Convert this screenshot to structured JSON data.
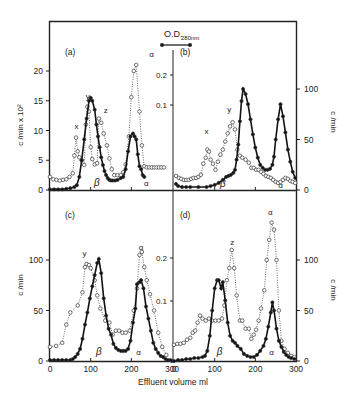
{
  "figure": {
    "xlabel": "Effluent volume  ml",
    "left_ylabel_top": "c /min x 10²",
    "left_ylabel_bottom": "c /min",
    "right_ylabel": "c /min",
    "od_label": "O.D.",
    "od_sub": "280nm",
    "colors": {
      "line": "#111111",
      "dotted": "#333333",
      "axis": "#222222"
    }
  },
  "chart_data": [
    {
      "panel": "a",
      "type": "line",
      "label": "(a)",
      "xlabel": "",
      "ylabel": "c /min x 10²",
      "xlim": [
        0,
        300
      ],
      "ylim": [
        0,
        23
      ],
      "yticks": [
        0,
        5,
        10,
        15,
        20
      ],
      "od_ticks": [
        "0.1",
        "0.2"
      ],
      "annotations": [
        {
          "text": "x",
          "x": 65,
          "y": 10.3
        },
        {
          "text": "y",
          "x": 93,
          "y": 15.3
        },
        {
          "text": "z",
          "x": 137,
          "y": 13.0
        },
        {
          "text": "α",
          "x": 250,
          "y": 22.3
        },
        {
          "text": "β",
          "x": 115,
          "y": 0.6,
          "italic": true
        },
        {
          "text": "α",
          "x": 237,
          "y": 0.6
        }
      ],
      "series": [
        {
          "name": "radioactivity (open circles)",
          "style": "dotted-open",
          "x": [
            0,
            8,
            16,
            24,
            32,
            40,
            48,
            56,
            60,
            64,
            68,
            72,
            78,
            84,
            88,
            92,
            96,
            100,
            104,
            110,
            116,
            120,
            126,
            132,
            140,
            146,
            152,
            158,
            166,
            174,
            180,
            186,
            194,
            200,
            206,
            212,
            220,
            226,
            232,
            238,
            244,
            250,
            256,
            262,
            268,
            274,
            280
          ],
          "y": [
            2.2,
            1.8,
            1.7,
            1.6,
            1.7,
            1.8,
            2.2,
            2.8,
            5.8,
            8.8,
            6.5,
            5.5,
            5.0,
            4.2,
            11.0,
            14.0,
            13.2,
            7.2,
            5.2,
            4.3,
            4.5,
            12.0,
            11.3,
            9.5,
            7.5,
            5.3,
            3.5,
            2.5,
            2.5,
            2.5,
            3.0,
            4.3,
            9.0,
            15.6,
            20.0,
            21.0,
            13.2,
            7.5,
            4.0,
            3.8,
            3.8,
            3.8,
            3.8,
            3.8,
            3.8,
            3.8,
            3.8
          ]
        },
        {
          "name": "protein (filled circles)",
          "style": "solid-filled",
          "x": [
            0,
            10,
            20,
            30,
            40,
            50,
            60,
            66,
            72,
            78,
            84,
            90,
            96,
            100,
            104,
            110,
            114,
            118,
            122,
            126,
            130,
            134,
            138,
            142,
            146,
            150,
            154,
            160,
            166,
            174,
            180,
            186,
            192,
            198,
            204,
            208,
            212,
            216,
            220,
            224,
            228,
            232
          ],
          "y": [
            0.1,
            0.1,
            0.1,
            0.1,
            0.2,
            0.3,
            0.5,
            0.8,
            2.2,
            5.0,
            8.5,
            12.0,
            15.0,
            15.5,
            15.0,
            13.5,
            11.0,
            9.0,
            7.2,
            5.5,
            4.2,
            3.2,
            2.5,
            2.0,
            1.7,
            1.6,
            1.6,
            1.6,
            1.7,
            2.0,
            2.2,
            3.5,
            6.5,
            9.0,
            9.5,
            9.0,
            8.5,
            6.0,
            4.0,
            3.5,
            2.5,
            2.2
          ]
        }
      ]
    },
    {
      "panel": "b",
      "type": "line",
      "label": "(b)",
      "ylabel": "c /min",
      "xlim": [
        0,
        300
      ],
      "ylim": [
        0,
        115
      ],
      "yticks": [
        0,
        50,
        100
      ],
      "annotations": [
        {
          "text": "x",
          "x": 80,
          "y": 55
        },
        {
          "text": "y",
          "x": 136,
          "y": 77
        },
        {
          "text": "β",
          "x": 120,
          "y": 3,
          "italic": true
        },
        {
          "text": "α",
          "x": 262,
          "y": 2
        }
      ],
      "series": [
        {
          "name": "radioactivity (open circles)",
          "style": "dotted-open",
          "x": [
            5,
            12,
            18,
            24,
            30,
            36,
            42,
            48,
            54,
            60,
            66,
            72,
            78,
            82,
            86,
            90,
            96,
            102,
            108,
            114,
            120,
            126,
            132,
            138,
            144,
            150,
            156,
            162,
            168,
            176,
            184,
            190,
            196,
            202,
            208,
            214,
            220,
            226,
            232,
            238,
            244,
            250,
            256,
            262,
            268,
            274,
            280,
            286,
            292,
            298
          ],
          "y": [
            14,
            12,
            11,
            10,
            10,
            10,
            11,
            12,
            12,
            13,
            15,
            26,
            32,
            40,
            38,
            30,
            26,
            20,
            28,
            35,
            40,
            48,
            56,
            63,
            67,
            60,
            40,
            34,
            32,
            30,
            27,
            22,
            22,
            20,
            20,
            18,
            16,
            14,
            13,
            12,
            10,
            8,
            7,
            8,
            10,
            12,
            11,
            9,
            8,
            7
          ],
          "note": "approximate"
        },
        {
          "name": "protein (filled circles)",
          "style": "solid-filled",
          "x": [
            5,
            10,
            20,
            30,
            40,
            60,
            80,
            90,
            100,
            110,
            120,
            128,
            134,
            140,
            146,
            150,
            154,
            158,
            162,
            166,
            170,
            176,
            182,
            188,
            194,
            200,
            206,
            212,
            218,
            224,
            230,
            236,
            242,
            246,
            250,
            256,
            262,
            268,
            274,
            280,
            286,
            292,
            298
          ],
          "y": [
            6,
            4,
            3,
            3,
            3,
            3,
            3,
            4,
            5,
            7,
            10,
            13,
            14,
            15,
            17,
            20,
            30,
            45,
            68,
            88,
            100,
            95,
            85,
            70,
            55,
            42,
            32,
            25,
            22,
            20,
            20,
            21,
            25,
            33,
            50,
            70,
            85,
            73,
            57,
            40,
            28,
            18,
            12
          ]
        }
      ]
    },
    {
      "panel": "c",
      "type": "line",
      "label": "(c)",
      "ylabel": "c /min",
      "xlim": [
        0,
        300
      ],
      "ylim": [
        0,
        150
      ],
      "yticks": [
        0,
        50,
        100
      ],
      "od_ticks": [
        "0.1",
        "0.2"
      ],
      "annotations": [
        {
          "text": "y",
          "x": 85,
          "y": 104
        },
        {
          "text": "α",
          "x": 224,
          "y": 110
        },
        {
          "text": "β",
          "x": 120,
          "y": 6,
          "italic": true
        },
        {
          "text": "α",
          "x": 218,
          "y": 6
        }
      ],
      "series": [
        {
          "name": "radioactivity (open circles)",
          "style": "dotted-open",
          "x": [
            0,
            15,
            30,
            40,
            50,
            68,
            80,
            86,
            90,
            96,
            100,
            110,
            116,
            124,
            136,
            146,
            154,
            162,
            170,
            178,
            186,
            196,
            206,
            214,
            220,
            226,
            232,
            238,
            246,
            256,
            266,
            276,
            286
          ],
          "y": [
            14,
            15,
            18,
            36,
            48,
            55,
            68,
            93,
            96,
            95,
            92,
            80,
            65,
            52,
            40,
            38,
            26,
            30,
            30,
            28,
            28,
            30,
            50,
            72,
            105,
            108,
            93,
            80,
            66,
            50,
            28,
            14,
            6
          ]
        },
        {
          "name": "protein (filled circles)",
          "style": "solid-filled",
          "x": [
            0,
            10,
            20,
            30,
            40,
            50,
            56,
            62,
            68,
            74,
            80,
            86,
            92,
            98,
            104,
            110,
            116,
            120,
            126,
            132,
            138,
            144,
            150,
            156,
            162,
            168,
            174,
            180,
            186,
            192,
            198,
            204,
            210,
            214,
            220,
            224,
            230,
            236,
            242,
            248,
            254,
            260,
            266,
            272,
            278,
            284,
            290,
            296,
            300
          ],
          "y": [
            1,
            1,
            1,
            1,
            1,
            1,
            2,
            4,
            7,
            12,
            22,
            36,
            48,
            62,
            74,
            85,
            97,
            101,
            87,
            62,
            45,
            32,
            26,
            17,
            13,
            11,
            10,
            10,
            10,
            12,
            20,
            38,
            52,
            76,
            78,
            80,
            72,
            54,
            42,
            30,
            18,
            12,
            8,
            5,
            4,
            2,
            1,
            1,
            0
          ]
        }
      ]
    },
    {
      "panel": "d",
      "type": "line",
      "label": "(d)",
      "ylabel": "c /min",
      "xlim": [
        0,
        300
      ],
      "ylim": [
        0,
        150
      ],
      "yticks": [
        0,
        50,
        100
      ],
      "annotations": [
        {
          "text": "z",
          "x": 143,
          "y": 115
        },
        {
          "text": "α",
          "x": 237,
          "y": 145
        },
        {
          "text": "β",
          "x": 112,
          "y": 6,
          "italic": true
        },
        {
          "text": "α",
          "x": 240,
          "y": 6
        }
      ],
      "series": [
        {
          "name": "radioactivity (open circles)",
          "style": "dotted-open",
          "x": [
            0,
            8,
            16,
            24,
            32,
            40,
            46,
            52,
            58,
            64,
            70,
            78,
            86,
            94,
            102,
            110,
            118,
            124,
            130,
            136,
            142,
            148,
            154,
            162,
            168,
            176,
            184,
            190,
            196,
            202,
            208,
            214,
            222,
            228,
            234,
            240,
            246,
            252,
            258,
            264,
            272,
            280,
            288,
            296
          ],
          "y": [
            16,
            17,
            17,
            18,
            21,
            23,
            28,
            30,
            38,
            45,
            42,
            40,
            42,
            40,
            40,
            40,
            42,
            55,
            80,
            92,
            110,
            92,
            65,
            40,
            40,
            32,
            32,
            22,
            26,
            31,
            40,
            52,
            70,
            100,
            120,
            137,
            130,
            100,
            50,
            20,
            12,
            8,
            5,
            4
          ]
        },
        {
          "name": "protein (filled circles)",
          "style": "solid-filled",
          "x": [
            0,
            10,
            20,
            30,
            40,
            50,
            60,
            70,
            76,
            82,
            88,
            94,
            100,
            106,
            110,
            116,
            120,
            126,
            132,
            138,
            144,
            150,
            156,
            164,
            172,
            180,
            188,
            196,
            204,
            212,
            220,
            226,
            232,
            238,
            242,
            246,
            252,
            258,
            264,
            270,
            276,
            282,
            288,
            296
          ],
          "y": [
            0,
            1,
            1,
            2,
            2,
            3,
            3,
            4,
            5,
            10,
            25,
            50,
            72,
            80,
            80,
            72,
            78,
            60,
            38,
            25,
            20,
            18,
            15,
            12,
            7,
            5,
            4,
            4,
            6,
            10,
            15,
            22,
            34,
            48,
            58,
            50,
            32,
            20,
            14,
            9,
            6,
            4,
            3,
            2
          ]
        }
      ]
    }
  ]
}
